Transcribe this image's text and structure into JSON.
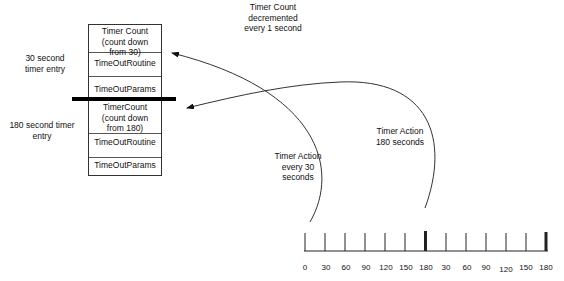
{
  "header_note": {
    "line1": "Timer Count",
    "line2": "decremented",
    "line3": "every 1 second"
  },
  "entries": [
    {
      "label_line1": "30 second",
      "label_line2": "timer entry",
      "cells": [
        "Timer Count (count down from 30)",
        "TimeOutRoutine",
        "TimeOutParams"
      ]
    },
    {
      "label_line1": "180 second timer",
      "label_line2": "entry",
      "cells": [
        "TimerCount (count down from 180)",
        "TimeOutRoutine",
        "TimeOutParams"
      ]
    }
  ],
  "actions": {
    "action_30": {
      "line1": "Timer Action",
      "line2": "every 30",
      "line3": "seconds"
    },
    "action_180": {
      "line1": "Timer Action",
      "line2": "180 seconds"
    }
  },
  "timeline": {
    "ticks": [
      "0",
      "30",
      "60",
      "90",
      "120",
      "150",
      "180",
      "30",
      "60",
      "90",
      "120",
      "150",
      "180"
    ],
    "emphasized_ticks": [
      6,
      12
    ]
  }
}
